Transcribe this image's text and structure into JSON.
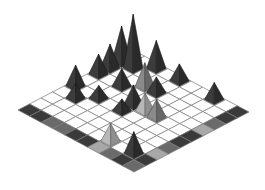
{
  "scene": {
    "type": "isometric-grid-with-pyramids",
    "grid_size": 10,
    "origin": [
      133,
      50
    ],
    "u": [
      11.6,
      6.2
    ],
    "v": [
      -11.5,
      6.0
    ],
    "colors": {
      "background": "#ffffff",
      "tile": "#ffffff",
      "grid_line": "#7a7a7a",
      "border_dark": "#3a3a3a",
      "border_mid": "#6a6a6a",
      "border_light": "#a8a8a8"
    },
    "border_cells": [
      {
        "i": 0,
        "j": 9,
        "shade": "dark"
      },
      {
        "i": 1,
        "j": 9,
        "shade": "dark"
      },
      {
        "i": 2,
        "j": 9,
        "shade": "mid"
      },
      {
        "i": 3,
        "j": 9,
        "shade": "mid"
      },
      {
        "i": 4,
        "j": 9,
        "shade": "dark"
      },
      {
        "i": 5,
        "j": 9,
        "shade": "dark"
      },
      {
        "i": 6,
        "j": 9,
        "shade": "light"
      },
      {
        "i": 7,
        "j": 9,
        "shade": "mid"
      },
      {
        "i": 8,
        "j": 9,
        "shade": "dark"
      },
      {
        "i": 9,
        "j": 9,
        "shade": "mid"
      },
      {
        "i": 9,
        "j": 0,
        "shade": "dark"
      },
      {
        "i": 9,
        "j": 1,
        "shade": "dark"
      },
      {
        "i": 9,
        "j": 2,
        "shade": "mid"
      },
      {
        "i": 9,
        "j": 3,
        "shade": "light"
      },
      {
        "i": 9,
        "j": 4,
        "shade": "dark"
      },
      {
        "i": 9,
        "j": 5,
        "shade": "dark"
      },
      {
        "i": 9,
        "j": 6,
        "shade": "mid"
      },
      {
        "i": 9,
        "j": 7,
        "shade": "light"
      },
      {
        "i": 9,
        "j": 8,
        "shade": "dark"
      }
    ],
    "pyramids": [
      {
        "i": 1,
        "j": 1,
        "h": 54,
        "shade": "dark"
      },
      {
        "i": 0,
        "j": 1,
        "h": 36,
        "shade": "dark"
      },
      {
        "i": 2,
        "j": 0,
        "h": 28,
        "shade": "dark"
      },
      {
        "i": 0,
        "j": 2,
        "h": 24,
        "shade": "dark"
      },
      {
        "i": 0,
        "j": 3,
        "h": 20,
        "shade": "dark"
      },
      {
        "i": 0,
        "j": 5,
        "h": 21,
        "shade": "dark"
      },
      {
        "i": 2,
        "j": 3,
        "h": 18,
        "shade": "dark"
      },
      {
        "i": 3,
        "j": 2,
        "h": 24,
        "shade": "mid"
      },
      {
        "i": 4,
        "j": 2,
        "h": 16,
        "shade": "dark"
      },
      {
        "i": 4,
        "j": 0,
        "h": 17,
        "shade": "dark"
      },
      {
        "i": 7,
        "j": 0,
        "h": 17,
        "shade": "dark"
      },
      {
        "i": 1,
        "j": 6,
        "h": 15,
        "shade": "dark"
      },
      {
        "i": 2,
        "j": 5,
        "h": 13,
        "shade": "dark"
      },
      {
        "i": 4,
        "j": 4,
        "h": 20,
        "shade": "dark"
      },
      {
        "i": 4,
        "j": 5,
        "h": 12,
        "shade": "dark"
      },
      {
        "i": 5,
        "j": 4,
        "h": 18,
        "shade": "light"
      },
      {
        "i": 6,
        "j": 4,
        "h": 18,
        "shade": "mid"
      },
      {
        "i": 6,
        "j": 8,
        "h": 18,
        "shade": "light"
      },
      {
        "i": 8,
        "j": 8,
        "h": 22,
        "shade": "dark"
      }
    ],
    "shades": {
      "dark": {
        "left": "#3c3c3c",
        "right": "#2a2a2a",
        "edge": "#1a1a1a"
      },
      "mid": {
        "left": "#8a8a8a",
        "right": "#666666",
        "edge": "#444444"
      },
      "light": {
        "left": "#b8b8b8",
        "right": "#8e8e8e",
        "edge": "#5a5a5a"
      }
    }
  },
  "labels": {
    "board": "Isometric game board",
    "description": "10 by 10 isometric grid with shaded border tiles and pyramid pieces"
  }
}
